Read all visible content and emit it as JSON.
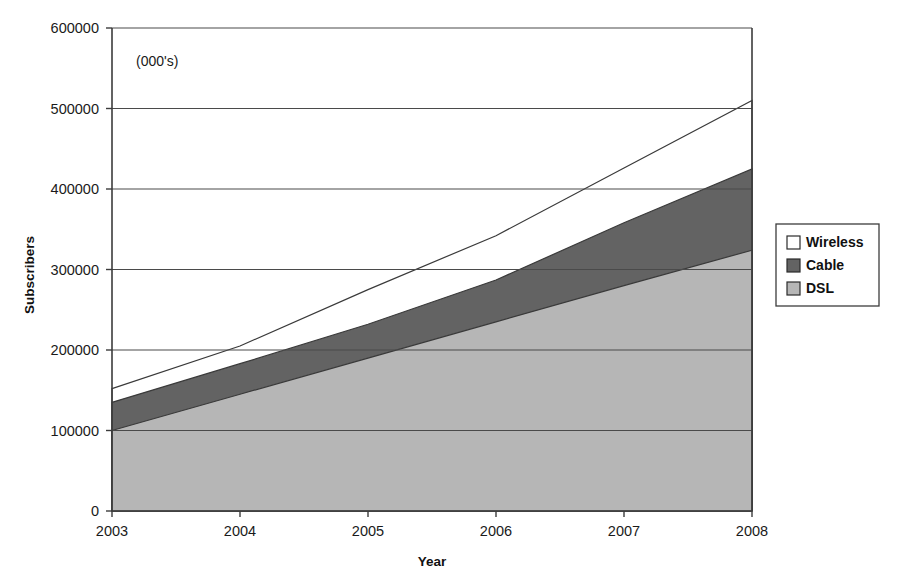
{
  "chart_data": {
    "type": "area",
    "stacked": true,
    "title": "",
    "subtitle": "",
    "units_note": "(000's)",
    "xlabel": "Year",
    "ylabel": "Subscribers",
    "categories": [
      "2003",
      "2004",
      "2005",
      "2006",
      "2007",
      "2008"
    ],
    "x": [
      2003,
      2004,
      2005,
      2006,
      2007,
      2008
    ],
    "xlim": [
      2003,
      2008
    ],
    "ylim": [
      0,
      600000
    ],
    "y_ticks": [
      0,
      100000,
      200000,
      300000,
      400000,
      500000,
      600000
    ],
    "y_tick_labels": [
      "0",
      "100000",
      "200000",
      "300000",
      "400000",
      "500000",
      "600000"
    ],
    "x_ticks": [
      2003,
      2004,
      2005,
      2006,
      2007,
      2008
    ],
    "x_tick_labels": [
      "2003",
      "2004",
      "2005",
      "2006",
      "2007",
      "2008"
    ],
    "grid": "horizontal",
    "legend_position": "right",
    "series": [
      {
        "name": "DSL",
        "color": "#b6b6b6",
        "values": [
          100000,
          145000,
          190000,
          235000,
          280000,
          324000
        ]
      },
      {
        "name": "Cable",
        "color": "#636363",
        "values": [
          35000,
          38000,
          42000,
          52000,
          78000,
          101000
        ]
      },
      {
        "name": "Wireless",
        "color": "#ffffff",
        "values": [
          17000,
          22000,
          43000,
          55000,
          68000,
          85000
        ]
      }
    ],
    "cumulative_tops": {
      "DSL": [
        100000,
        145000,
        190000,
        235000,
        280000,
        324000
      ],
      "Cable": [
        135000,
        183000,
        232000,
        287000,
        358000,
        425000
      ],
      "Wireless": [
        152000,
        205000,
        275000,
        342000,
        426000,
        510000
      ]
    }
  },
  "axes": {
    "y_title": "Subscribers",
    "x_title": "Year",
    "units_note": "(000's)"
  },
  "legend": {
    "entries": [
      {
        "label": "Wireless",
        "swatch": "#ffffff"
      },
      {
        "label": "Cable",
        "swatch": "#636363"
      },
      {
        "label": "DSL",
        "swatch": "#b6b6b6"
      }
    ]
  },
  "colors": {
    "wireless": "#ffffff",
    "cable": "#636363",
    "dsl": "#b6b6b6",
    "axis": "#3c3c3c",
    "grid": "#4a4a4a",
    "text": "#1a1a1a",
    "background": "#ffffff"
  }
}
